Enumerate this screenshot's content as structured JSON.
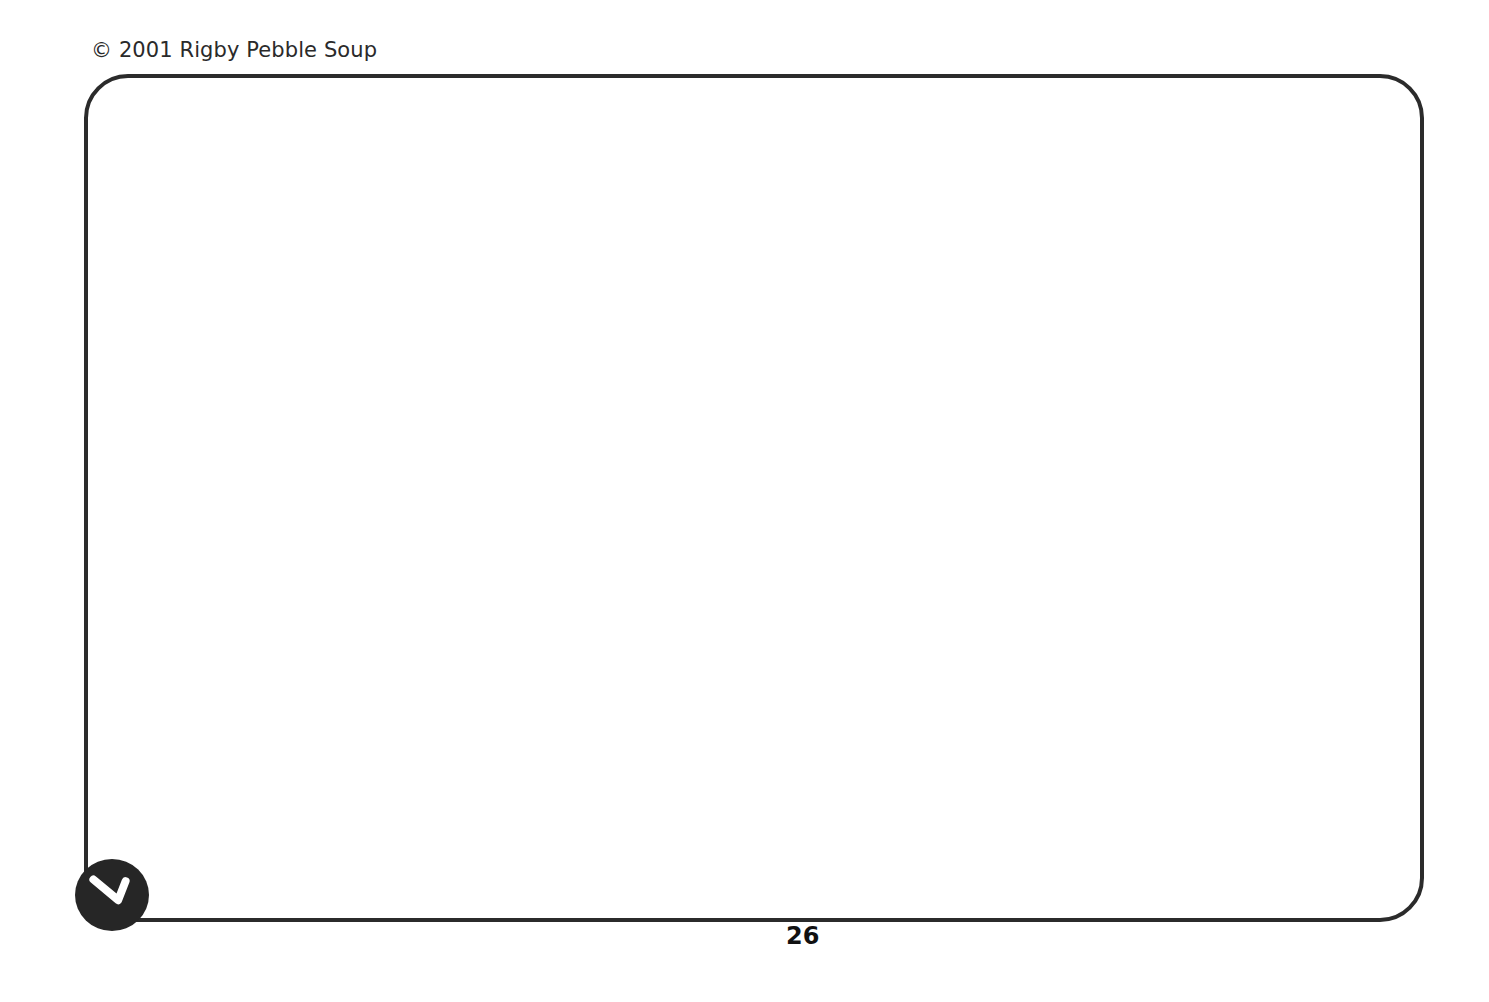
{
  "page": {
    "copyright": "© 2001 Rigby Pebble Soup",
    "page_number": "26",
    "badge_icon": "check-mark-icon",
    "frame_border_color": "#2b2b2b"
  }
}
